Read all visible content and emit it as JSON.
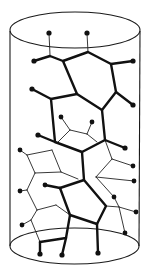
{
  "figure": {
    "title": "Helical molecular network wrapped on a cylinder",
    "colors": {
      "line": "#111111",
      "background": "#ffffff"
    },
    "cylinder": {
      "top_ellipse": {
        "cx": 75,
        "cy": 30,
        "rx": 65,
        "ry": 18
      },
      "bottom_ellipse": {
        "cx": 74,
        "cy": 246,
        "rx": 64,
        "ry": 18
      },
      "left_wall_x": 10,
      "right_wall_x": 140
    },
    "atoms": [
      [
        49,
        33
      ],
      [
        87,
        33
      ],
      [
        34,
        61
      ],
      [
        133,
        61
      ],
      [
        32,
        89
      ],
      [
        133,
        105
      ],
      [
        61,
        117
      ],
      [
        92,
        122
      ],
      [
        38,
        135
      ],
      [
        125,
        148
      ],
      [
        20,
        150
      ],
      [
        133,
        166
      ],
      [
        20,
        191
      ],
      [
        45,
        185
      ],
      [
        114,
        197
      ],
      [
        134,
        181
      ],
      [
        136,
        212
      ],
      [
        22,
        225
      ],
      [
        125,
        233
      ],
      [
        40,
        254
      ],
      [
        62,
        255
      ],
      [
        98,
        253
      ]
    ]
  }
}
